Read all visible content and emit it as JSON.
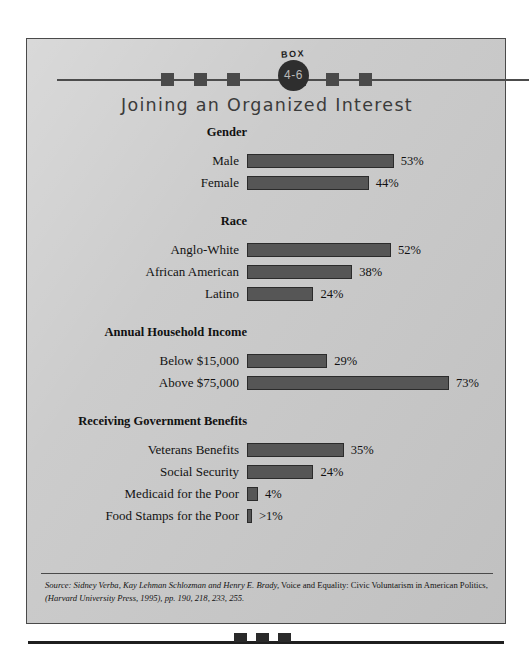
{
  "badge": {
    "word": "BOX",
    "number": "4-6"
  },
  "title": "Joining an Organized Interest",
  "decoration": {
    "top_squares_x": [
      160,
      193,
      226,
      292,
      325,
      358
    ],
    "bottom_squares_x": [
      234,
      256,
      278
    ]
  },
  "colors": {
    "page_background": "#c9c9c9",
    "bar_fill": "#565656",
    "bar_border": "#2b2b2b",
    "frame_border": "#4a4a4a",
    "badge_circle": "#2e2e2e",
    "title_text": "#3b3b3b"
  },
  "chart_data": {
    "type": "bar",
    "orientation": "horizontal",
    "title": "Joining an Organized Interest",
    "xlabel": "",
    "ylabel": "",
    "xlim": [
      0,
      73
    ],
    "grid": false,
    "legend": false,
    "value_suffix": "%",
    "groups": [
      {
        "heading": "Gender",
        "rows": [
          {
            "label": "Male",
            "value": 53,
            "value_label": "53%"
          },
          {
            "label": "Female",
            "value": 44,
            "value_label": "44%"
          }
        ]
      },
      {
        "heading": "Race",
        "rows": [
          {
            "label": "Anglo-White",
            "value": 52,
            "value_label": "52%"
          },
          {
            "label": "African American",
            "value": 38,
            "value_label": "38%"
          },
          {
            "label": "Latino",
            "value": 24,
            "value_label": "24%"
          }
        ]
      },
      {
        "heading": "Annual Household Income",
        "rows": [
          {
            "label": "Below $15,000",
            "value": 29,
            "value_label": "29%"
          },
          {
            "label": "Above $75,000",
            "value": 73,
            "value_label": "73%"
          }
        ]
      },
      {
        "heading": "Receiving Government Benefits",
        "rows": [
          {
            "label": "Veterans Benefits",
            "value": 35,
            "value_label": "35%"
          },
          {
            "label": "Social Security",
            "value": 24,
            "value_label": "24%"
          },
          {
            "label": "Medicaid for the Poor",
            "value": 4,
            "value_label": "4%"
          },
          {
            "label": "Food Stamps for the Poor",
            "value": 1,
            "value_label": ">1%"
          }
        ]
      }
    ]
  },
  "source": {
    "prefix": "Source:",
    "authors": "Sidney Verba, Kay Lehman Schlozman and Henry E. Brady,",
    "work": "Voice and Equality: Civic Voluntarism in American Politics,",
    "publisher": "(Harvard University Press, 1995),",
    "pages": "pp. 190, 218, 233, 255."
  }
}
